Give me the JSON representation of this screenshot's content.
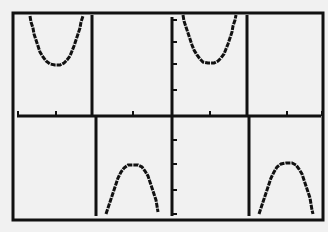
{
  "screen": {
    "background": "#f1f1f1",
    "ink": "#111111"
  },
  "chart_data": {
    "type": "line",
    "title": "",
    "xlabel": "",
    "ylabel": "",
    "grid": false,
    "legend": null,
    "frame": {
      "x1": 13,
      "y1": 13,
      "x2": 323,
      "y2": 220
    },
    "axes": {
      "x_axis_y": 116,
      "y_axis_x": 172,
      "x_ticks_px": [
        18,
        56,
        133,
        210,
        287,
        322
      ],
      "y_ticks_px": [
        20,
        42,
        64,
        90,
        140,
        164,
        190,
        214
      ]
    },
    "asymptotes": [
      {
        "x_top": 92,
        "x_bottom": 96
      },
      {
        "x_top": 247,
        "x_bottom": 249
      }
    ],
    "series": [
      {
        "name": "branch-up-1",
        "direction": "up",
        "points": [
          [
            30,
            16
          ],
          [
            31,
            22
          ],
          [
            33,
            28
          ],
          [
            34,
            34
          ],
          [
            36,
            40
          ],
          [
            38,
            46
          ],
          [
            40,
            52
          ],
          [
            43,
            57
          ],
          [
            46,
            61
          ],
          [
            50,
            64
          ],
          [
            55,
            65
          ],
          [
            60,
            65
          ],
          [
            64,
            63
          ],
          [
            67,
            60
          ],
          [
            70,
            56
          ],
          [
            72,
            51
          ],
          [
            74,
            46
          ],
          [
            76,
            40
          ],
          [
            78,
            34
          ],
          [
            80,
            28
          ],
          [
            81,
            22
          ],
          [
            83,
            16
          ]
        ]
      },
      {
        "name": "branch-down-1",
        "direction": "down",
        "points": [
          [
            106,
            214
          ],
          [
            108,
            208
          ],
          [
            110,
            202
          ],
          [
            112,
            196
          ],
          [
            114,
            190
          ],
          [
            116,
            184
          ],
          [
            118,
            178
          ],
          [
            121,
            172
          ],
          [
            124,
            168
          ],
          [
            128,
            165
          ],
          [
            133,
            165
          ],
          [
            138,
            165
          ],
          [
            142,
            167
          ],
          [
            145,
            171
          ],
          [
            148,
            176
          ],
          [
            150,
            182
          ],
          [
            152,
            188
          ],
          [
            154,
            194
          ],
          [
            156,
            200
          ],
          [
            157,
            206
          ],
          [
            158,
            212
          ]
        ]
      },
      {
        "name": "branch-up-2",
        "direction": "up",
        "points": [
          [
            183,
            15
          ],
          [
            184,
            21
          ],
          [
            186,
            27
          ],
          [
            188,
            33
          ],
          [
            190,
            39
          ],
          [
            192,
            45
          ],
          [
            194,
            50
          ],
          [
            197,
            55
          ],
          [
            200,
            59
          ],
          [
            203,
            62
          ],
          [
            208,
            63
          ],
          [
            214,
            63
          ],
          [
            218,
            61
          ],
          [
            221,
            58
          ],
          [
            224,
            54
          ],
          [
            226,
            49
          ],
          [
            228,
            44
          ],
          [
            230,
            38
          ],
          [
            232,
            32
          ],
          [
            233,
            26
          ],
          [
            235,
            20
          ],
          [
            236,
            15
          ]
        ]
      },
      {
        "name": "branch-down-2",
        "direction": "down",
        "points": [
          [
            259,
            214
          ],
          [
            261,
            208
          ],
          [
            263,
            202
          ],
          [
            265,
            196
          ],
          [
            267,
            190
          ],
          [
            269,
            184
          ],
          [
            271,
            178
          ],
          [
            274,
            172
          ],
          [
            277,
            167
          ],
          [
            281,
            164
          ],
          [
            286,
            163
          ],
          [
            292,
            163
          ],
          [
            296,
            165
          ],
          [
            299,
            169
          ],
          [
            302,
            174
          ],
          [
            304,
            180
          ],
          [
            306,
            186
          ],
          [
            308,
            192
          ],
          [
            310,
            198
          ],
          [
            311,
            204
          ],
          [
            312,
            210
          ],
          [
            313,
            214
          ]
        ]
      }
    ]
  }
}
